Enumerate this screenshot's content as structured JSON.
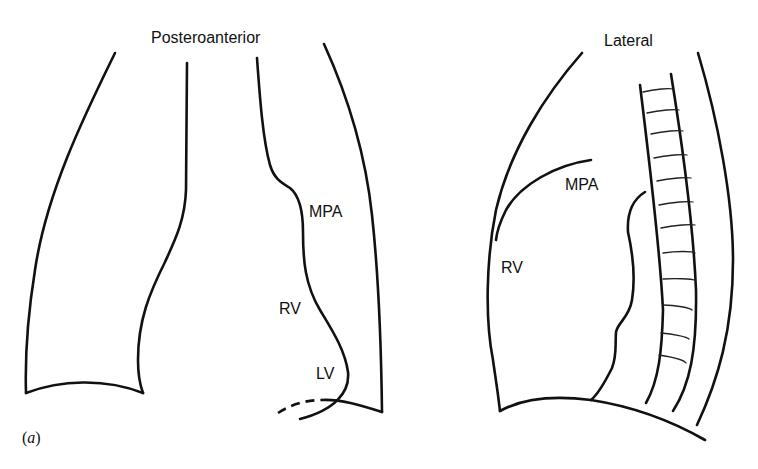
{
  "panels": {
    "posteroanterior": {
      "title": "Posteroanterior",
      "labels": {
        "mpa": "MPA",
        "rv": "RV",
        "lv": "LV"
      }
    },
    "lateral": {
      "title": "Lateral",
      "labels": {
        "mpa": "MPA",
        "rv": "RV"
      }
    }
  },
  "caption": {
    "open": "(",
    "letter": "a",
    "close": ")"
  },
  "colors": {
    "line": "#111111",
    "background": "#ffffff"
  }
}
